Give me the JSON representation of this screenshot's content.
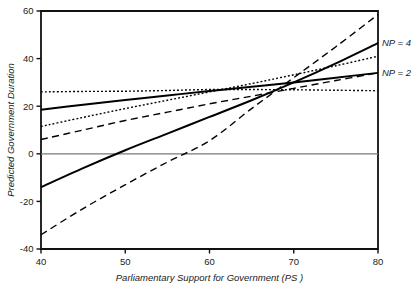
{
  "chart_data": {
    "type": "line",
    "title": "",
    "xlabel": "Parliamentary Support for Government (PS )",
    "ylabel": "Predicted Government Duration",
    "xlim": [
      40,
      80
    ],
    "ylim": [
      -40,
      60
    ],
    "xticks": [
      40,
      50,
      60,
      70,
      80
    ],
    "yticks": [
      -40,
      -20,
      0,
      20,
      40,
      60
    ],
    "xtick_labels": [
      "40",
      "50",
      "60",
      "70",
      "80"
    ],
    "ytick_labels": [
      "-40",
      "-20",
      "0",
      "20",
      "40",
      "60"
    ],
    "grid": false,
    "legend_position": "right-inline",
    "zero_reference_line": 0,
    "x": [
      40,
      45,
      50,
      55,
      60,
      65,
      70,
      75,
      80
    ],
    "series": [
      {
        "name": "NP = 2 predicted",
        "style": "solid",
        "label": "NP = 2",
        "label_x": 80,
        "label_y": 34,
        "color": "#000000",
        "width": 2.0,
        "values": [
          18.5,
          20.6,
          22.6,
          24.5,
          26.4,
          28.2,
          30.0,
          32.0,
          34.0
        ]
      },
      {
        "name": "NP = 4 predicted",
        "style": "solid",
        "label": "NP = 4",
        "label_x": 80,
        "label_y": 46.5,
        "color": "#000000",
        "width": 2.0,
        "values": [
          -14.0,
          -6.0,
          1.5,
          8.5,
          15.5,
          22.5,
          30.0,
          38.0,
          46.5
        ]
      },
      {
        "name": "NP = 2 confidence upper",
        "style": "dotted",
        "label": "",
        "color": "#000000",
        "width": 1.4,
        "values": [
          26.0,
          26.2,
          26.3,
          26.6,
          27.0,
          27.0,
          26.9,
          26.7,
          26.5
        ]
      },
      {
        "name": "NP = 4 confidence upper",
        "style": "dotted",
        "label": "",
        "color": "#000000",
        "width": 1.4,
        "values": [
          11.5,
          15.3,
          19.0,
          22.5,
          26.0,
          29.5,
          33.2,
          37.0,
          41.0
        ]
      },
      {
        "name": "NP = 2 confidence lower",
        "style": "dashed",
        "label": "",
        "color": "#000000",
        "width": 1.4,
        "values": [
          6.0,
          10.0,
          14.0,
          17.5,
          21.0,
          24.2,
          27.5,
          30.8,
          34.0
        ]
      },
      {
        "name": "NP = 4 confidence lower",
        "style": "dashed",
        "label": "",
        "color": "#000000",
        "width": 1.4,
        "values": [
          -34.0,
          -23.0,
          -13.0,
          -3.5,
          5.5,
          19.0,
          32.0,
          45.0,
          58.5
        ]
      }
    ]
  },
  "axis": {
    "x_title": "Parliamentary Support for Government (PS )",
    "y_title": "Predicted Government Duration"
  },
  "legend": {
    "items": [
      {
        "label": "NP = 4"
      },
      {
        "label": "NP = 2"
      }
    ]
  }
}
